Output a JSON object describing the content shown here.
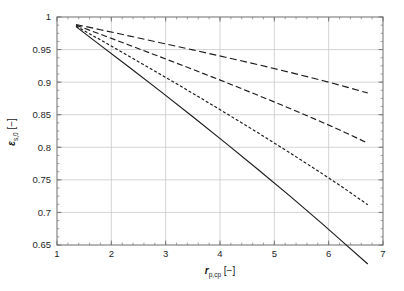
{
  "figure": {
    "background_color": "#ffffff",
    "frame_color": "#7a7a7a",
    "grid_color": "#c9c9c9",
    "curve_color": "#1a1a1a"
  },
  "axes": {
    "x": {
      "title_symbol": "r",
      "title_subscript": "p,cp",
      "title_unit": "[−]",
      "min": 1,
      "max": 7,
      "major_ticks": [
        1,
        2,
        3,
        4,
        5,
        6,
        7
      ],
      "tick_labels": [
        "1",
        "2",
        "3",
        "4",
        "5",
        "6",
        "7"
      ],
      "minor_tick_step": 0.2
    },
    "y": {
      "title_symbol": "ε",
      "title_subscript": "s,0",
      "title_unit": "[−]",
      "min": 0.65,
      "max": 1,
      "major_ticks": [
        0.65,
        0.7,
        0.75,
        0.8,
        0.85,
        0.9,
        0.95,
        1
      ],
      "tick_labels": [
        "0.65",
        "0.7",
        "0.75",
        "0.8",
        "0.85",
        "0.9",
        "0.95",
        "1"
      ],
      "minor_tick_step": 0.0125
    }
  },
  "chart_data": {
    "type": "line",
    "title": "",
    "xlabel": "r_p,cp [−]",
    "ylabel": "ε_s,0 [−]",
    "xlim": [
      1,
      7
    ],
    "ylim": [
      0.65,
      1
    ],
    "grid": true,
    "legend_position": "none",
    "series": [
      {
        "name": "curve-1-long-dash",
        "style": "long-dash",
        "dasharray": "7,3.5",
        "x": [
          1.35,
          1.8,
          2.3,
          2.9,
          3.5,
          4.1,
          4.7,
          5.3,
          5.9,
          6.3,
          6.72
        ],
        "y": [
          0.9885,
          0.9805,
          0.9715,
          0.9605,
          0.9495,
          0.9383,
          0.9268,
          0.9148,
          0.9022,
          0.8932,
          0.8833
        ]
      },
      {
        "name": "curve-2-medium-dash",
        "style": "medium-dash",
        "dasharray": "6,3",
        "x": [
          1.35,
          1.8,
          2.3,
          2.9,
          3.5,
          4.1,
          4.7,
          5.3,
          5.9,
          6.3,
          6.72
        ],
        "y": [
          0.9875,
          0.9735,
          0.9578,
          0.9388,
          0.9195,
          0.9,
          0.8798,
          0.8592,
          0.8378,
          0.8228,
          0.8064
        ]
      },
      {
        "name": "curve-3-short-dash",
        "style": "short-dash",
        "dasharray": "3,2",
        "x": [
          1.35,
          1.8,
          2.3,
          2.9,
          3.5,
          4.1,
          4.7,
          5.3,
          5.9,
          6.3,
          6.72
        ],
        "y": [
          0.9862,
          0.9648,
          0.941,
          0.9122,
          0.8828,
          0.8528,
          0.8222,
          0.7908,
          0.7585,
          0.7362,
          0.7118
        ]
      },
      {
        "name": "curve-4-solid",
        "style": "solid",
        "dasharray": "",
        "x": [
          1.35,
          1.8,
          2.3,
          2.9,
          3.5,
          4.1,
          4.7,
          5.3,
          5.9,
          6.3,
          6.72
        ],
        "y": [
          0.9852,
          0.9565,
          0.9248,
          0.8862,
          0.8468,
          0.8068,
          0.766,
          0.7242,
          0.6812,
          0.6518,
          0.6208
        ]
      }
    ]
  }
}
